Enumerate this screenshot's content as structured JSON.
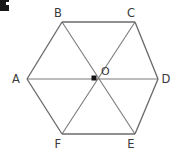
{
  "figure": {
    "type": "geometry-diagram",
    "shape_name": "regular-hexagon",
    "background_color": "#ffffff",
    "line_color": "#6b6b6b",
    "diagonal_color": "#7a7a7a",
    "label_color": "#3a3a3a",
    "center_dot_color": "#141414",
    "corner_mark_color": "#171717",
    "vertices": [
      {
        "id": "A",
        "label": "A",
        "x": 27,
        "y": 79,
        "label_x": 16,
        "label_y": 83
      },
      {
        "id": "B",
        "label": "B",
        "x": 62,
        "y": 22,
        "label_x": 58,
        "label_y": 17
      },
      {
        "id": "C",
        "label": "C",
        "x": 135,
        "y": 22,
        "label_x": 131,
        "label_y": 17
      },
      {
        "id": "D",
        "label": "D",
        "x": 158,
        "y": 79,
        "label_x": 166,
        "label_y": 83
      },
      {
        "id": "E",
        "label": "E",
        "x": 135,
        "y": 134,
        "label_x": 131,
        "label_y": 148
      },
      {
        "id": "F",
        "label": "F",
        "x": 62,
        "y": 134,
        "label_x": 58,
        "label_y": 148
      }
    ],
    "center": {
      "id": "O",
      "label": "O",
      "x": 94,
      "y": 78,
      "label_x": 101,
      "label_y": 75,
      "dot_size": 5
    },
    "edges": [
      {
        "from": "A",
        "to": "B"
      },
      {
        "from": "B",
        "to": "C"
      },
      {
        "from": "C",
        "to": "D"
      },
      {
        "from": "D",
        "to": "E"
      },
      {
        "from": "E",
        "to": "F"
      },
      {
        "from": "F",
        "to": "A"
      }
    ],
    "diagonals": [
      {
        "from": "A",
        "to": "D"
      },
      {
        "from": "B",
        "to": "E"
      },
      {
        "from": "C",
        "to": "F"
      }
    ],
    "triangle_count": 6
  }
}
